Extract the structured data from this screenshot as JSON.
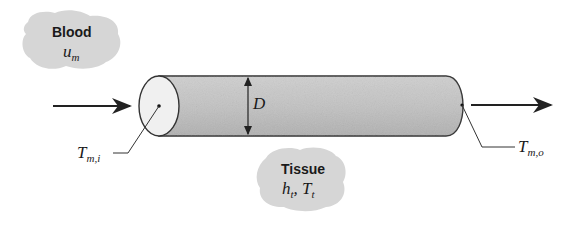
{
  "blood_cloud": {
    "title": "Blood",
    "symbol": "u",
    "symbol_sub": "m"
  },
  "tissue_cloud": {
    "title": "Tissue",
    "symbol1": "h",
    "symbol1_sub": "t",
    "sep": ", ",
    "symbol2": "T",
    "symbol2_sub": "t"
  },
  "diameter_label": "D",
  "inlet_temp": {
    "symbol": "T",
    "sub": "m,i"
  },
  "outlet_temp": {
    "symbol": "T",
    "sub": "m,o"
  },
  "colors": {
    "cylinder": "#bdbdbd",
    "cloud": "#d4d4d4",
    "line": "#222222"
  }
}
